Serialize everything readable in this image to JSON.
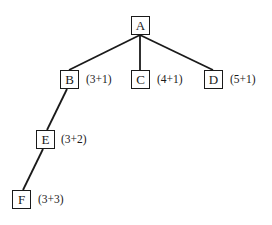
{
  "diagram": {
    "type": "tree",
    "nodes": [
      {
        "id": "A",
        "label": "A",
        "annotation": ""
      },
      {
        "id": "B",
        "label": "B",
        "annotation": "(3+1)"
      },
      {
        "id": "C",
        "label": "C",
        "annotation": "(4+1)"
      },
      {
        "id": "D",
        "label": "D",
        "annotation": "(5+1)"
      },
      {
        "id": "E",
        "label": "E",
        "annotation": "(3+2)"
      },
      {
        "id": "F",
        "label": "F",
        "annotation": "(3+3)"
      }
    ],
    "edges": [
      {
        "from": "A",
        "to": "B"
      },
      {
        "from": "A",
        "to": "C"
      },
      {
        "from": "A",
        "to": "D"
      },
      {
        "from": "B",
        "to": "E"
      },
      {
        "from": "E",
        "to": "F"
      }
    ],
    "colors": {
      "line": "#1a1a1a",
      "background": "#ffffff"
    }
  }
}
